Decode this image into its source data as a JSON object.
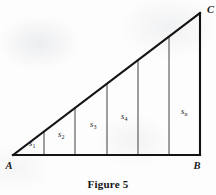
{
  "figure": {
    "caption": "Figure 5",
    "background_color": "#fdfdfd",
    "ink_color": "#1a1a1a",
    "vertices": {
      "a": {
        "label": "A",
        "x": 13,
        "y": 155
      },
      "b": {
        "label": "B",
        "x": 200,
        "y": 155
      },
      "c": {
        "label": "C",
        "x": 200,
        "y": 13
      }
    },
    "edges": {
      "base_label": "AB",
      "vertical_label": "BC",
      "hypotenuse_label": "AC"
    },
    "divider_x": [
      44,
      75,
      107,
      138,
      169
    ],
    "strips": [
      {
        "label": "s",
        "subscript": "1",
        "label_x": 29,
        "label_y": 146,
        "shown": true
      },
      {
        "label": "s",
        "subscript": "2",
        "label_x": 58,
        "label_y": 137,
        "shown": true
      },
      {
        "label": "s",
        "subscript": "3",
        "label_x": 90,
        "label_y": 127,
        "shown": true
      },
      {
        "label": "s",
        "subscript": "4",
        "label_x": 121,
        "label_y": 119,
        "shown": true
      },
      {
        "label": "",
        "subscript": "",
        "label_x": 152,
        "label_y": 110,
        "shown": false
      },
      {
        "label": "s",
        "subscript": "n",
        "label_x": 181,
        "label_y": 114,
        "shown": true
      }
    ]
  }
}
